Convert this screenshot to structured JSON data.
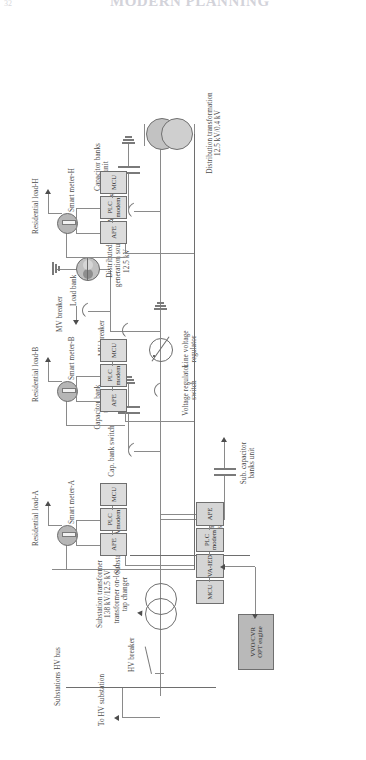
{
  "page": {
    "number": "32",
    "header_title": "MODERN PLANNING",
    "width": 366,
    "height": 760
  },
  "diagram": {
    "type": "single-line-diagram",
    "orientation": "rotated-90-ccw",
    "source_label": "To HV substation",
    "buses": [
      {
        "id": "hv-bus",
        "label": "Substations HV bus"
      },
      {
        "id": "mv-bus",
        "label": "Substation MV bus"
      }
    ],
    "substation": {
      "hv_breaker_label": "HV breaker",
      "transformer_label": "Substation transformer\n138 kV/12.5 kV\ntransformer on-load\ntap changer",
      "transformer_primary_kv": "138 kV",
      "transformer_secondary_kv": "12.5 kV",
      "cap_bank_switch_label": "Cap. bank\nswitch",
      "cap_bank_unit_label": "Sub. capacitor\nbanks unit",
      "controller": {
        "engine_label": "VVO/CVR\nOPT engine",
        "modules": [
          {
            "id": "mcu",
            "label": "MCU"
          },
          {
            "id": "va-ied",
            "label": "VA-IED"
          },
          {
            "id": "plc-modem",
            "label": "PLC\nmodem"
          },
          {
            "id": "afe",
            "label": "AFE"
          }
        ]
      }
    },
    "feeder": {
      "cap_bank_switch_label": "Cap. bank switch",
      "cap_bank_unit_label": "Capacitor bank\nunit",
      "voltage_regulator_switch_label": "Voltage regulator\nswitch",
      "line_voltage_regulator_label": "Line voltage\nregulator",
      "mv_breaker_label": "MV breaker",
      "load_bank_label": "Load bank",
      "dg_source_label": "Distributed\ngeneration source\n12.5 kV",
      "dg_source_kv": "12.5 kV",
      "capacitor_banks_unit_label": "Capacitor banks\nunit",
      "distribution_transformer_label": "Distribution transformation\n12.5 kV/0.4 kV",
      "distribution_transformer_ratio": "12.5 kV/0.4 kV"
    },
    "customers": [
      {
        "id": "a",
        "load_label": "Residential load-A",
        "meter_label": "Smart meter-A",
        "modules": [
          {
            "id": "afe",
            "label": "AFE"
          },
          {
            "id": "plc-modem",
            "label": "PLC\nmodem"
          },
          {
            "id": "mcu",
            "label": "MCU"
          }
        ]
      },
      {
        "id": "b",
        "load_label": "Residential load-B",
        "meter_label": "Smart meter-B",
        "modules": [
          {
            "id": "afe",
            "label": "AFE"
          },
          {
            "id": "plc-modem",
            "label": "PLC\nmodem"
          },
          {
            "id": "mcu",
            "label": "MCU"
          }
        ]
      },
      {
        "id": "h",
        "load_label": "Residential load-H",
        "meter_label": "Smart meter-H",
        "modules": [
          {
            "id": "afe",
            "label": "AFE"
          },
          {
            "id": "plc-modem",
            "label": "PLC\nmodem"
          },
          {
            "id": "mcu",
            "label": "MCU"
          }
        ]
      }
    ],
    "colors": {
      "line": "#8a8a8a",
      "box_fill": "#d5d5d5",
      "box_stroke": "#6f6f6f",
      "meter_fill": "#b6b6b6",
      "engine_fill": "#b9b9b9",
      "text": "#4a4a4a"
    }
  }
}
